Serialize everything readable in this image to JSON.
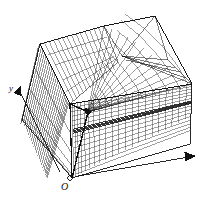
{
  "figure": {
    "background_color": "#ffffff",
    "line_color": "#111111",
    "width": 210,
    "height": 198
  },
  "axes": {
    "origin_label": "O",
    "x_label": "x",
    "y_label": "y",
    "z_label": "",
    "x_arrow_icon": "arrow-right-icon",
    "y_arrow_icon": "arrow-upleft-icon"
  },
  "mesh": {
    "description": "Cube domain discretised with anisotropically graded hexahedral mesh refined toward an interior singular point; coarse triangulated patch on the top-right of the upper face.",
    "cube_vertices_2d": {
      "origin_bottom": [
        72,
        178
      ],
      "left_bottom": [
        22,
        120
      ],
      "right_bottom": [
        190,
        144
      ],
      "front_top": [
        70,
        104
      ],
      "left_top": [
        40,
        44
      ],
      "top_apex": [
        155,
        16
      ],
      "right_top": [
        192,
        84
      ],
      "back_top": [
        104,
        26
      ]
    },
    "focus_point_2d": [
      88,
      112
    ],
    "grid_divisions_fine": 22,
    "grid_divisions_coarse": 8,
    "refinement_band_y": 130
  }
}
